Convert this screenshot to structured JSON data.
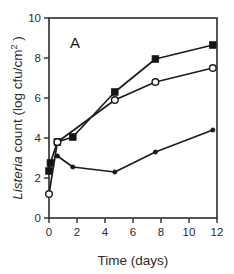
{
  "figure": {
    "panel_label": "A",
    "background_color": "#ffffff",
    "ink_color": "#1c1c1c"
  },
  "chart_data": {
    "type": "line",
    "title": "",
    "panel": "A",
    "xlabel": "Time (days)",
    "ylabel": "Listeria count (log cfu/cm 2 )",
    "ylabel_parts": {
      "italic": "Listeria",
      "roman_before_paren": " count (log cfu/cm",
      "superscript": "2",
      "roman_after": " )"
    },
    "xlim": [
      0,
      12
    ],
    "ylim": [
      0,
      10
    ],
    "xticks": [
      0,
      2,
      4,
      6,
      8,
      10,
      12
    ],
    "yticks": [
      0,
      2,
      4,
      6,
      8,
      10
    ],
    "xticklabels": [
      "0",
      "2",
      "4",
      "6",
      "8",
      "10",
      "12"
    ],
    "yticklabels": [
      "0",
      "2",
      "4",
      "6",
      "8",
      "10"
    ],
    "grid": false,
    "legend": "none",
    "tick_direction": "out",
    "frame": "full-box",
    "series": [
      {
        "name": "filled-square",
        "marker": "filled-square",
        "x": [
          0,
          0.1,
          0.6,
          1.7,
          4.7,
          7.6,
          11.7
        ],
        "y": [
          2.35,
          2.75,
          3.8,
          4.05,
          6.3,
          7.95,
          8.65
        ]
      },
      {
        "name": "open-circle",
        "marker": "open-circle",
        "x": [
          0,
          0.6,
          4.7,
          7.6,
          11.7
        ],
        "y": [
          1.2,
          3.8,
          5.9,
          6.8,
          7.5
        ]
      },
      {
        "name": "small-filled-circle",
        "marker": "filled-circle",
        "x": [
          0.6,
          1.7,
          4.7,
          7.6,
          11.7
        ],
        "y": [
          3.1,
          2.55,
          2.3,
          3.3,
          4.4
        ]
      }
    ]
  }
}
